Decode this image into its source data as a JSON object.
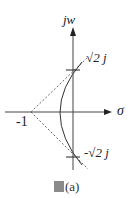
{
  "diagram": {
    "type": "root-locus",
    "axes": {
      "vertical_label": "jw",
      "horizontal_label": "σ"
    },
    "points": {
      "real_axis_mark": "-1",
      "upper_crossing": "√2 j",
      "lower_crossing": "-√2 j"
    },
    "asymptotes": "dashed lines from -1 at ±45°",
    "caption": "圖(a)",
    "caption_suffix": "(a)"
  }
}
